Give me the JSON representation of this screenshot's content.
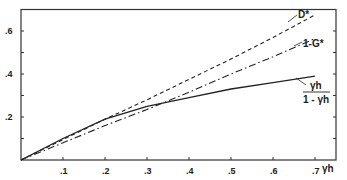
{
  "chart_data": {
    "type": "line",
    "title": "",
    "xlabel": "γh",
    "ylabel": "",
    "xlim": [
      0,
      0.75
    ],
    "ylim": [
      0,
      0.7
    ],
    "grid": false,
    "legend": "inline labels at line ends",
    "x_ticks": [
      0.1,
      0.2,
      0.3,
      0.4,
      0.5,
      0.6,
      0.7
    ],
    "x_tick_labels": [
      ".1",
      ".2",
      ".3",
      ".4",
      ".5",
      ".6",
      ".7"
    ],
    "y_ticks": [
      0.1,
      0.2,
      0.3,
      0.4,
      0.5,
      0.6
    ],
    "y_tick_labels": [
      "",
      ".2",
      "",
      ".4",
      "",
      ".6"
    ],
    "x": [
      0,
      0.1,
      0.2,
      0.3,
      0.4,
      0.5,
      0.6,
      0.7
    ],
    "series": [
      {
        "name": "D*",
        "style": "dashed",
        "values": [
          0,
          0.095,
          0.19,
          0.28,
          0.375,
          0.47,
          0.57,
          0.675
        ]
      },
      {
        "name": "1-G*",
        "style": "dash-dot",
        "values": [
          0,
          0.08,
          0.16,
          0.235,
          0.315,
          0.4,
          0.48,
          0.565
        ]
      },
      {
        "name": "γh / (1 - γh)",
        "style": "solid",
        "values": [
          0,
          0.1,
          0.19,
          0.25,
          0.29,
          0.33,
          0.36,
          0.39
        ]
      }
    ],
    "annotations": [
      {
        "text": "D*",
        "near": "end of dashed curve"
      },
      {
        "text": "1-G*",
        "near": "end of dash-dot curve"
      },
      {
        "text": "γh / (1-γh)",
        "near": "end of solid curve"
      }
    ]
  },
  "labels": {
    "x_axis_title": "γh",
    "d_star": "D*",
    "one_minus_g": "1-G*",
    "frac_num": "γh",
    "frac_den": "1 - γh"
  }
}
